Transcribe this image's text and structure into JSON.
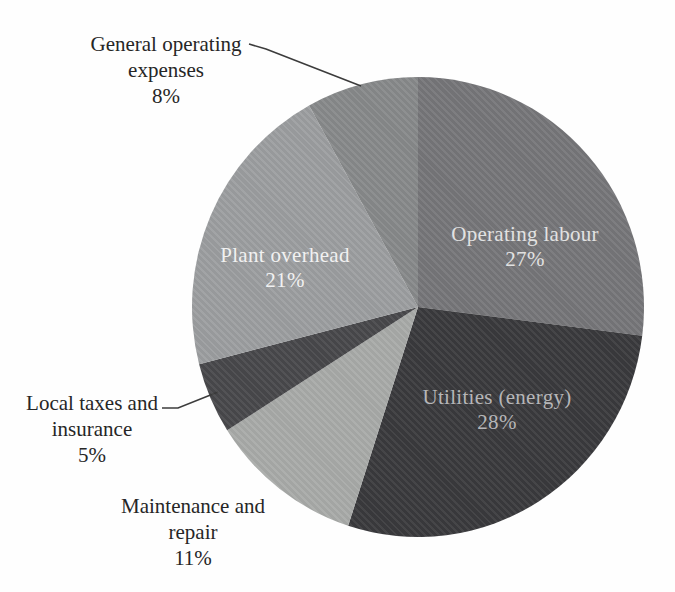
{
  "chart_data": {
    "type": "pie",
    "title": "",
    "start_angle_deg": 0,
    "direction": "clockwise",
    "legend": "none",
    "background": "#fefefe",
    "label_style": "large slices labeled inside; small slices labeled outside with leader lines",
    "slices": [
      {
        "label": "Operating labour",
        "value": 27,
        "pct_label": "27%",
        "color": "#767679",
        "text_color": "#e2e2e2",
        "label_placement": "inside"
      },
      {
        "label": "Utilities (energy)",
        "value": 28,
        "pct_label": "28%",
        "color": "#3a3a3d",
        "text_color": "#b6b6b8",
        "label_placement": "inside"
      },
      {
        "label": "Maintenance and repair",
        "value": 11,
        "pct_label": "11%",
        "color": "#a8aaa8",
        "text_color": "#262626",
        "label_placement": "outside"
      },
      {
        "label": "Local taxes and insurance",
        "value": 5,
        "pct_label": "5%",
        "color": "#48484b",
        "text_color": "#262626",
        "label_placement": "outside"
      },
      {
        "label": "Plant overhead",
        "value": 21,
        "pct_label": "21%",
        "color": "#9c9ea0",
        "text_color": "#f1f1f1",
        "label_placement": "inside"
      },
      {
        "label": "General operating expenses",
        "value": 8,
        "pct_label": "8%",
        "color": "#87898a",
        "text_color": "#262626",
        "label_placement": "outside"
      }
    ],
    "leader_line_color": "#3c3c3c"
  },
  "labels": {
    "general_operating": {
      "lines": [
        "General operating",
        "expenses"
      ]
    },
    "local_taxes": {
      "lines": [
        "Local taxes and",
        "insurance"
      ]
    },
    "maintenance": {
      "lines": [
        "Maintenance and",
        "repair"
      ]
    }
  }
}
